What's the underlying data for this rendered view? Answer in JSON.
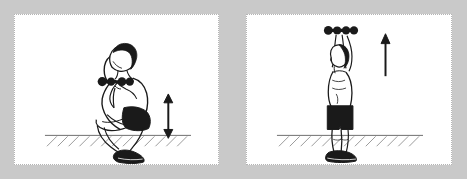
{
  "document": {
    "title": "Dumbbell Squat to Overhead Press",
    "type": "exercise-illustration",
    "panel_count": 2
  },
  "colors": {
    "background": "#c9c9c9",
    "panel_fill": "#ffffff",
    "panel_border": "#b4b4b4",
    "ink": "#1a1a1a",
    "shade": "#222222",
    "hatch": "#8c8c8c",
    "ground_line": "#6e6e6e"
  },
  "panels": [
    {
      "id": "panel-1",
      "name": "squat-position",
      "figure": {
        "name": "athlete-squatting",
        "pose": "deep squat, dumbbells racked at shoulders",
        "equipment": "dumbbells",
        "shorts_color": "#1a1a1a",
        "hair_color": "#1a1a1a",
        "shoes_color": "#1a1a1a"
      },
      "arrow": {
        "name": "vertical-double-arrow",
        "direction": "up-down",
        "heads": 2
      },
      "ground": {
        "name": "ground-hatching",
        "hatch_marks": 14
      }
    },
    {
      "id": "panel-2",
      "name": "overhead-press-position",
      "figure": {
        "name": "athlete-standing-overhead",
        "pose": "standing tall, dumbbells pressed overhead",
        "equipment": "dumbbells",
        "shorts_color": "#1a1a1a",
        "hair_color": "#1a1a1a",
        "shoes_color": "#1a1a1a"
      },
      "arrow": {
        "name": "vertical-up-arrow",
        "direction": "up",
        "heads": 1
      },
      "ground": {
        "name": "ground-hatching",
        "hatch_marks": 14
      }
    }
  ]
}
